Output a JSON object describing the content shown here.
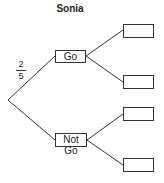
{
  "title": "Sonia",
  "branch_probability": {
    "numerator": "2",
    "denominator": "5"
  },
  "first_level": [
    {
      "label": "Go"
    },
    {
      "label": "Not Go"
    }
  ],
  "second_level": [
    {
      "label": ""
    },
    {
      "label": ""
    },
    {
      "label": ""
    },
    {
      "label": ""
    }
  ]
}
